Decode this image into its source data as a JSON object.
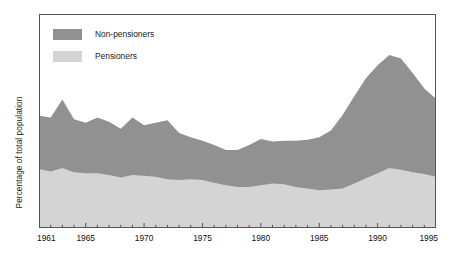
{
  "chart_data": {
    "type": "area",
    "stacked": true,
    "title": "",
    "subtitle": "",
    "xlabel": "",
    "ylabel": "Percentage of total population",
    "xlim": [
      1961,
      1995
    ],
    "ylim": [
      0,
      25
    ],
    "grid": false,
    "y_tick_labels": [],
    "legend_position": "inside top-left",
    "x": [
      1961,
      1962,
      1963,
      1964,
      1965,
      1966,
      1967,
      1968,
      1969,
      1970,
      1971,
      1972,
      1973,
      1974,
      1975,
      1976,
      1977,
      1978,
      1979,
      1980,
      1981,
      1982,
      1983,
      1984,
      1985,
      1986,
      1987,
      1988,
      1989,
      1990,
      1991,
      1992,
      1993,
      1994,
      1995
    ],
    "x_tick_labels": [
      "1961",
      "1965",
      "1970",
      "1975",
      "1980",
      "1985",
      "1990",
      "1995"
    ],
    "x_tick_values": [
      1961,
      1965,
      1970,
      1975,
      1980,
      1985,
      1990,
      1995
    ],
    "series": [
      {
        "name": "Pensioners",
        "color": "#d4d4d4",
        "values": [
          6.9,
          6.6,
          7.0,
          6.5,
          6.4,
          6.4,
          6.2,
          5.9,
          6.2,
          6.1,
          6.0,
          5.7,
          5.6,
          5.7,
          5.6,
          5.3,
          5.0,
          4.8,
          4.8,
          5.0,
          5.2,
          5.1,
          4.8,
          4.6,
          4.4,
          4.5,
          4.6,
          5.2,
          5.8,
          6.4,
          7.0,
          6.8,
          6.5,
          6.3,
          6.0
        ]
      },
      {
        "name": "Non-pensioners",
        "color": "#919191",
        "values": [
          6.2,
          6.3,
          8.0,
          6.2,
          5.9,
          6.5,
          6.2,
          5.7,
          6.7,
          5.9,
          6.3,
          6.9,
          5.5,
          4.9,
          4.6,
          4.4,
          4.1,
          4.3,
          4.9,
          5.4,
          4.9,
          5.1,
          5.4,
          5.7,
          6.2,
          6.9,
          8.6,
          10.2,
          11.7,
          12.6,
          13.2,
          13.0,
          11.6,
          10.0,
          9.1
        ]
      }
    ],
    "totals": [
      13.1,
      12.9,
      15.0,
      12.7,
      12.3,
      12.9,
      12.4,
      11.6,
      12.9,
      12.0,
      12.3,
      12.6,
      11.1,
      10.6,
      10.2,
      9.7,
      9.1,
      9.1,
      9.7,
      10.4,
      10.1,
      10.2,
      10.2,
      10.3,
      10.6,
      11.4,
      13.2,
      15.4,
      17.5,
      19.0,
      20.2,
      19.8,
      18.1,
      16.3,
      15.1
    ]
  },
  "legend": {
    "items": [
      {
        "label": "Non-pensioners",
        "color": "#919191"
      },
      {
        "label": "Pensioners",
        "color": "#d4d4d4"
      }
    ]
  },
  "axes": {
    "y_label": "Percentage of total population",
    "x_tick_labels": [
      "1961",
      "1965",
      "1970",
      "1975",
      "1980",
      "1985",
      "1990",
      "1995"
    ]
  },
  "colors": {
    "non_pensioners": "#919191",
    "pensioners": "#d4d4d4",
    "frame": "#555555",
    "text": "#1a1a1a",
    "background": "#ffffff"
  }
}
